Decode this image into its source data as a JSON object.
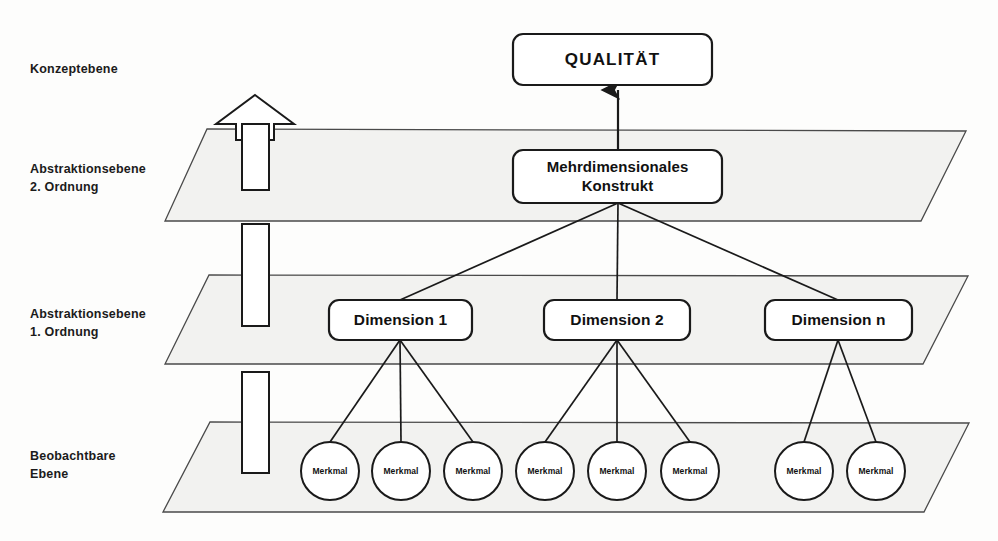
{
  "diagram": {
    "colors": {
      "stroke": "#1a1a1a",
      "plane_fill": "#f2f2f0",
      "plane_stroke": "#4a4a4a",
      "box_fill": "#ffffff",
      "text": "#111111",
      "background": "#fdfdfc"
    },
    "levels": [
      {
        "id": "konzeptebene",
        "label": "Konzeptebene",
        "x": 30,
        "y": 60
      },
      {
        "id": "abstraktion-2",
        "label": "Abstraktionsebene\n2. Ordnung",
        "x": 30,
        "y": 160
      },
      {
        "id": "abstraktion-1",
        "label": "Abstraktionsebene\n1. Ordnung",
        "x": 30,
        "y": 305
      },
      {
        "id": "beobachtbare-ebene",
        "label": "Beobachtbare\nEbene",
        "x": 30,
        "y": 447
      }
    ],
    "planes": [
      {
        "id": "plane-abstraktion-2",
        "points": "207,129 966,131 921,221 165,221"
      },
      {
        "id": "plane-abstraktion-1",
        "points": "209,275 968,276 923,364 165,364"
      },
      {
        "id": "plane-beobachtbare",
        "points": "210,422 969,423 924,512 163,512"
      }
    ],
    "up_arrow": {
      "id": "aufstieg-pfeil",
      "head": "255,95 294,124 274,124 274,140 236,140 236,124 216,124",
      "segments": [
        {
          "x": 242,
          "y": 124,
          "w": 27,
          "h": 66
        },
        {
          "x": 242,
          "y": 224,
          "w": 27,
          "h": 102
        },
        {
          "x": 242,
          "y": 372,
          "w": 27,
          "h": 101
        }
      ]
    },
    "nodes": {
      "qualitaet": {
        "label": "QUALITÄT",
        "x": 513,
        "y": 34,
        "w": 199,
        "h": 51,
        "r": 10
      },
      "konstrukt": {
        "label": "Mehrdimensionales\nKonstrukt",
        "x": 513,
        "y": 150,
        "w": 209,
        "h": 53,
        "r": 10
      },
      "dimensions": [
        {
          "id": "dimension-1",
          "label": "Dimension 1",
          "x": 329,
          "y": 300,
          "w": 143,
          "h": 40,
          "r": 10
        },
        {
          "id": "dimension-2",
          "label": "Dimension 2",
          "x": 544,
          "y": 300,
          "w": 146,
          "h": 40,
          "r": 10
        },
        {
          "id": "dimension-n",
          "label": "Dimension n",
          "x": 765,
          "y": 300,
          "w": 147,
          "h": 40,
          "r": 10
        }
      ],
      "merkmale": [
        {
          "id": "merkmal-1-1",
          "label": "Merkmal",
          "cx": 330,
          "cy": 471,
          "r": 29,
          "parent": "dimension-1"
        },
        {
          "id": "merkmal-1-2",
          "label": "Merkmal",
          "cx": 401,
          "cy": 471,
          "r": 29,
          "parent": "dimension-1"
        },
        {
          "id": "merkmal-1-3",
          "label": "Merkmal",
          "cx": 473,
          "cy": 471,
          "r": 29,
          "parent": "dimension-1"
        },
        {
          "id": "merkmal-2-1",
          "label": "Merkmal",
          "cx": 545,
          "cy": 471,
          "r": 29,
          "parent": "dimension-2"
        },
        {
          "id": "merkmal-2-2",
          "label": "Merkmal",
          "cx": 617,
          "cy": 471,
          "r": 29,
          "parent": "dimension-2"
        },
        {
          "id": "merkmal-2-3",
          "label": "Merkmal",
          "cx": 690,
          "cy": 471,
          "r": 29,
          "parent": "dimension-2"
        },
        {
          "id": "merkmal-n-1",
          "label": "Merkmal",
          "cx": 804,
          "cy": 471,
          "r": 29,
          "parent": "dimension-n"
        },
        {
          "id": "merkmal-n-2",
          "label": "Merkmal",
          "cx": 876,
          "cy": 471,
          "r": 29,
          "parent": "dimension-n"
        }
      ]
    },
    "connectors": {
      "konstrukt_to_qualitaet": {
        "x1": 618,
        "y1": 150,
        "x2": 618,
        "y2": 90,
        "arrow": true
      },
      "konstrukt_to_dimensions": [
        {
          "x1": 618,
          "y1": 203,
          "x2": 400,
          "y2": 300
        },
        {
          "x1": 618,
          "y1": 203,
          "x2": 617,
          "y2": 300
        },
        {
          "x1": 618,
          "y1": 203,
          "x2": 838,
          "y2": 300
        }
      ],
      "dimensions_to_merkmale": [
        {
          "x1": 400,
          "y1": 340,
          "x2": 330,
          "y2": 442
        },
        {
          "x1": 400,
          "y1": 340,
          "x2": 401,
          "y2": 442
        },
        {
          "x1": 400,
          "y1": 340,
          "x2": 473,
          "y2": 442
        },
        {
          "x1": 617,
          "y1": 340,
          "x2": 545,
          "y2": 442
        },
        {
          "x1": 617,
          "y1": 340,
          "x2": 617,
          "y2": 442
        },
        {
          "x1": 617,
          "y1": 340,
          "x2": 690,
          "y2": 442
        },
        {
          "x1": 838,
          "y1": 340,
          "x2": 804,
          "y2": 442
        },
        {
          "x1": 838,
          "y1": 340,
          "x2": 876,
          "y2": 442
        }
      ]
    }
  }
}
